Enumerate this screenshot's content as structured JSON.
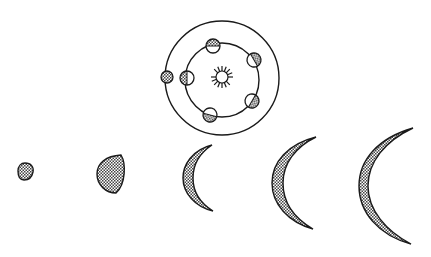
{
  "diagram": {
    "colors": {
      "stroke": "#1a1a1a",
      "background": "#ffffff",
      "shade": "#555555"
    },
    "orbit_system": {
      "sun": {
        "cx": 222,
        "cy": 77,
        "r": 6,
        "ray_length": 5,
        "rays": 14
      },
      "outer_orbit": {
        "cx": 222,
        "cy": 78,
        "r": 57
      },
      "inner_orbit": {
        "cx": 222,
        "cy": 80,
        "r": 37
      },
      "earth_marker": {
        "cx": 167,
        "cy": 77,
        "r": 6,
        "shading": "full"
      },
      "inner_planets": [
        {
          "cx": 213,
          "cy": 46,
          "r": 7,
          "shaded_side": "top"
        },
        {
          "cx": 254,
          "cy": 60,
          "r": 7,
          "shaded_side": "right"
        },
        {
          "cx": 252,
          "cy": 101,
          "r": 7,
          "shaded_side": "lower-right"
        },
        {
          "cx": 210,
          "cy": 115,
          "r": 7,
          "shaded_side": "bottom"
        },
        {
          "cx": 187,
          "cy": 78,
          "r": 7,
          "shaded_side": "left"
        }
      ]
    },
    "phases": [
      {
        "name": "gibbous-small",
        "x": 18,
        "y": 163,
        "w": 15,
        "h": 17
      },
      {
        "name": "gibbous-large",
        "x": 97,
        "y": 155,
        "w": 27,
        "h": 38
      },
      {
        "name": "crescent-1",
        "x": 183,
        "y": 144,
        "w": 30,
        "h": 68
      },
      {
        "name": "crescent-2",
        "x": 272,
        "y": 136,
        "w": 44,
        "h": 93
      },
      {
        "name": "crescent-3",
        "x": 359,
        "y": 127,
        "w": 54,
        "h": 117
      }
    ]
  }
}
